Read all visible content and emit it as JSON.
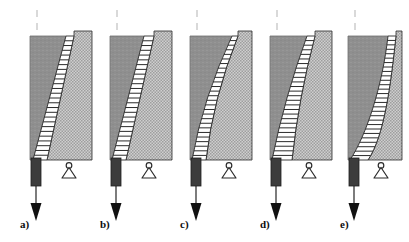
{
  "figure": {
    "background_color": "#ffffff",
    "width": 409,
    "height": 242,
    "panel_count": 5
  },
  "palette": {
    "solid_gray": "#8f8f8f",
    "solid_gray_edge": "#6e6e6e",
    "stipple_gray": "#b8b8b8",
    "stipple_dot": "#9a9a9a",
    "hatch_band_fill": "#ffffff",
    "hatch_band_line": "#2b2b2b",
    "column_dark": "#3c3c3c",
    "column_dark_edge": "#1e1e1e",
    "outline": "#2b2b2b",
    "arrow_color": "#111111",
    "dashed_line": "#c9c9c9",
    "label_color": "#0d0d0d"
  },
  "legend_semantics": {
    "solid_gray_region": "intact-soil-mass",
    "hatched_band_region": "shear-transition-band",
    "stipple_region": "failed-wedge-region",
    "dark_column": "loaded-pile-or-wall",
    "triangle_support": "pin-support",
    "down_arrow": "applied-load",
    "dashed_top_line": "centerline"
  },
  "panels": [
    {
      "id": "a",
      "label": "a)",
      "label_x": 20,
      "label_y": 228,
      "block_x": 30,
      "block_top": 36,
      "block_bottom": 160,
      "block_right": 92,
      "right_top": 31,
      "band_top_left": 66,
      "band_top_right": 74,
      "band_bottom_left": 33,
      "band_bottom_right": 47,
      "band_shape": "straight",
      "curve_bulge": 0,
      "hatch_lines": 26,
      "column_x": 31,
      "column_w": 10,
      "column_top": 158,
      "column_bottom": 186,
      "stem_bottom": 206,
      "arrow_tip": 221,
      "support_cx": 69,
      "support_y": 160,
      "dash_x": 37,
      "dash_top": 10,
      "dash_bottom": 33
    },
    {
      "id": "b",
      "label": "b)",
      "label_x": 100,
      "label_y": 228,
      "block_x": 110,
      "block_top": 36,
      "block_bottom": 160,
      "block_right": 172,
      "right_top": 31,
      "band_top_left": 144,
      "band_top_right": 154,
      "band_bottom_left": 112,
      "band_bottom_right": 126,
      "band_shape": "straight",
      "curve_bulge": 0,
      "hatch_lines": 26,
      "column_x": 111,
      "column_w": 10,
      "column_top": 158,
      "column_bottom": 186,
      "stem_bottom": 206,
      "arrow_tip": 221,
      "support_cx": 149,
      "support_y": 160,
      "dash_x": 117,
      "dash_top": 10,
      "dash_bottom": 33
    },
    {
      "id": "c",
      "label": "c)",
      "label_x": 180,
      "label_y": 228,
      "block_x": 190,
      "block_top": 36,
      "block_bottom": 160,
      "block_right": 252,
      "right_top": 31,
      "band_top_left": 232,
      "band_top_right": 238,
      "band_bottom_left": 192,
      "band_bottom_right": 206,
      "band_shape": "curved",
      "curve_bulge": 9,
      "hatch_lines": 27,
      "column_x": 191,
      "column_w": 10,
      "column_top": 158,
      "column_bottom": 186,
      "stem_bottom": 206,
      "arrow_tip": 221,
      "support_cx": 229,
      "support_y": 160,
      "dash_x": 197,
      "dash_top": 10,
      "dash_bottom": 33
    },
    {
      "id": "d",
      "label": "d)",
      "label_x": 260,
      "label_y": 228,
      "block_x": 270,
      "block_top": 36,
      "block_bottom": 160,
      "block_right": 332,
      "right_top": 31,
      "band_top_left": 307,
      "band_top_right": 315,
      "band_bottom_left": 272,
      "band_bottom_right": 292,
      "band_shape": "curved",
      "curve_bulge": 5,
      "hatch_lines": 27,
      "column_x": 271,
      "column_w": 10,
      "column_top": 158,
      "column_bottom": 186,
      "stem_bottom": 206,
      "arrow_tip": 221,
      "support_cx": 309,
      "support_y": 160,
      "dash_x": 277,
      "dash_top": 10,
      "dash_bottom": 33
    },
    {
      "id": "e",
      "label": "e)",
      "label_x": 340,
      "label_y": 228,
      "block_x": 348,
      "block_top": 36,
      "block_bottom": 160,
      "block_right": 402,
      "right_top": 31,
      "band_top_left": 388,
      "band_top_right": 396,
      "band_bottom_left": 350,
      "band_bottom_right": 368,
      "band_shape": "concave",
      "curve_bulge": 22,
      "hatch_lines": 28,
      "column_x": 349,
      "column_w": 10,
      "column_top": 158,
      "column_bottom": 186,
      "stem_bottom": 206,
      "arrow_tip": 221,
      "support_cx": 381,
      "support_y": 160,
      "dash_x": 355,
      "dash_top": 10,
      "dash_bottom": 33
    }
  ]
}
